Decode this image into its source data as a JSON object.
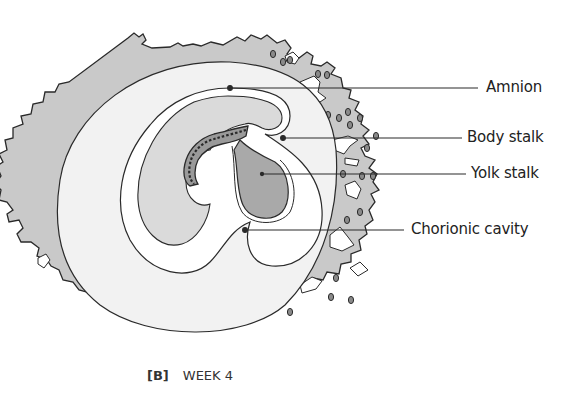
{
  "figure": {
    "type": "embryology-cross-section",
    "labels": [
      {
        "id": "amnion",
        "text": "Amnion"
      },
      {
        "id": "body-stalk",
        "text": "Body stalk"
      },
      {
        "id": "yolk-stalk",
        "text": "Yolk stalk"
      },
      {
        "id": "chorionic-cavity",
        "text": "Chorionic cavity"
      }
    ],
    "caption": {
      "panel": "[B]",
      "text": "WEEK 4"
    },
    "colors": {
      "chorion": "#c9c9c9",
      "cavity": "#f2f2f2",
      "yolk_sac": "#a9a9a9",
      "amnion_fill": "#dadada",
      "outline": "#2a2a2a"
    }
  }
}
